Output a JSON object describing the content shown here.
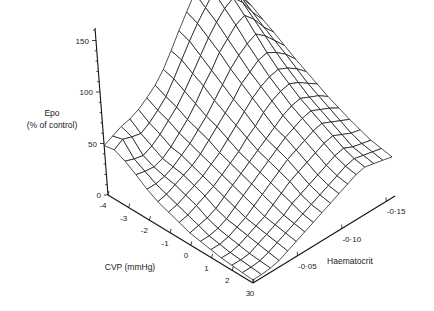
{
  "chart_data": {
    "type": "surface3d",
    "title": "",
    "zlabel_line1": "Epo",
    "zlabel_line2": "(% of control)",
    "xlabel": "CVP (mmHg)",
    "ylabel": "Haematocrit",
    "z_ticks": [
      0,
      50,
      100,
      150
    ],
    "z_tick_labels": [
      "0",
      "50",
      "100",
      "150"
    ],
    "x_ticks": [
      -4,
      -3,
      -2,
      -1,
      0,
      1,
      2,
      3
    ],
    "x_tick_labels": [
      "-4",
      "-3",
      "-2",
      "-1",
      "0",
      "1",
      "2",
      "3"
    ],
    "y_ticks": [
      0,
      -0.05,
      -0.1,
      -0.15
    ],
    "y_tick_labels": [
      "0",
      "-0·05",
      "-0·10",
      "-0·15"
    ],
    "xlim": [
      -4,
      3
    ],
    "ylim": [
      0,
      -0.16
    ],
    "zlim": [
      0,
      160
    ],
    "grid_x": [
      -4,
      -3.5,
      -3,
      -2.5,
      -2,
      -1.5,
      -1,
      -0.5,
      0,
      0.5,
      1,
      1.5,
      2,
      2.5,
      3
    ],
    "grid_y": [
      0,
      -0.01,
      -0.02,
      -0.03,
      -0.04,
      -0.05,
      -0.06,
      -0.07,
      -0.08,
      -0.09,
      -0.1,
      -0.11,
      -0.12,
      -0.13,
      -0.14,
      -0.15,
      -0.16
    ],
    "z_values": [
      [
        48,
        52,
        56,
        58,
        62,
        68,
        75,
        85,
        98,
        112,
        125,
        138,
        150,
        162,
        142,
        120,
        110
      ],
      [
        50,
        55,
        52,
        50,
        55,
        62,
        70,
        82,
        95,
        108,
        120,
        130,
        140,
        148,
        135,
        118,
        105
      ],
      [
        45,
        42,
        40,
        44,
        50,
        58,
        66,
        76,
        88,
        100,
        112,
        122,
        130,
        135,
        125,
        110,
        98
      ],
      [
        38,
        36,
        35,
        38,
        44,
        52,
        60,
        70,
        82,
        92,
        104,
        112,
        120,
        124,
        115,
        102,
        92
      ],
      [
        30,
        30,
        32,
        36,
        42,
        48,
        56,
        64,
        74,
        84,
        94,
        102,
        108,
        112,
        105,
        95,
        85
      ],
      [
        24,
        26,
        30,
        34,
        38,
        44,
        52,
        60,
        68,
        76,
        86,
        92,
        98,
        100,
        95,
        88,
        78
      ],
      [
        20,
        22,
        26,
        30,
        34,
        40,
        46,
        54,
        62,
        70,
        78,
        84,
        88,
        90,
        86,
        80,
        72
      ],
      [
        16,
        18,
        22,
        26,
        30,
        36,
        42,
        48,
        56,
        62,
        70,
        76,
        80,
        82,
        78,
        72,
        66
      ],
      [
        12,
        14,
        16,
        20,
        26,
        32,
        38,
        44,
        50,
        56,
        62,
        68,
        72,
        74,
        70,
        66,
        60
      ],
      [
        10,
        10,
        12,
        16,
        22,
        28,
        34,
        40,
        46,
        52,
        58,
        62,
        66,
        68,
        64,
        60,
        55
      ],
      [
        8,
        8,
        10,
        14,
        18,
        24,
        30,
        36,
        42,
        48,
        52,
        56,
        60,
        62,
        58,
        54,
        50
      ],
      [
        6,
        6,
        8,
        12,
        16,
        20,
        26,
        32,
        38,
        42,
        46,
        50,
        54,
        56,
        52,
        48,
        46
      ],
      [
        5,
        5,
        6,
        10,
        14,
        18,
        22,
        28,
        32,
        36,
        40,
        44,
        48,
        50,
        46,
        44,
        42
      ],
      [
        4,
        4,
        5,
        8,
        12,
        16,
        20,
        24,
        28,
        32,
        36,
        40,
        44,
        46,
        44,
        42,
        40
      ],
      [
        3,
        3,
        4,
        6,
        10,
        14,
        18,
        22,
        26,
        30,
        34,
        38,
        42,
        44,
        42,
        40,
        38
      ]
    ],
    "grid": false,
    "legend": null
  },
  "axes": {
    "origin_screen": [
      108,
      195
    ],
    "x_end_screen": [
      253,
      283
    ],
    "y_end_screen": [
      395,
      196
    ],
    "z_px_per_unit": 1.03,
    "z_top_screen": [
      95,
      28
    ]
  }
}
